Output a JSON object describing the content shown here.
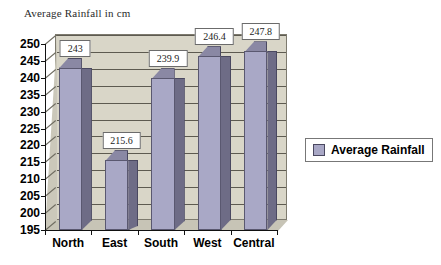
{
  "chart_data": {
    "type": "bar",
    "title": "Average Rainfall in cm",
    "xlabel": "",
    "ylabel": "",
    "categories": [
      "North",
      "East",
      "South",
      "West",
      "Central"
    ],
    "values": [
      243,
      215.6,
      239.9,
      246.4,
      247.8
    ],
    "data_labels": [
      "243",
      "215.6",
      "239.9",
      "246.4",
      "247.8"
    ],
    "ylim": [
      195,
      250
    ],
    "ytick_step": 5,
    "ytick_labels": [
      "250",
      "245",
      "240",
      "235",
      "230",
      "225",
      "220",
      "215",
      "210",
      "205",
      "200",
      "195"
    ],
    "grid": true,
    "legend": {
      "position": "right",
      "entries": [
        {
          "label": "Average Rainfall",
          "color": "#a9a8c6"
        }
      ]
    },
    "series": [
      {
        "name": "Average Rainfall",
        "values": [
          243,
          215.6,
          239.9,
          246.4,
          247.8
        ]
      }
    ],
    "style": {
      "bar_face_color": "#a9a8c6",
      "bar_side_color": "#6e6c86",
      "bar_top_color": "#8a88a4",
      "plot_background": "#d9d6c8",
      "gridline_color": "#5d5a50",
      "axis_color": "#111111",
      "label_box_background": "#ffffff",
      "page_background": "#ffffff"
    }
  }
}
